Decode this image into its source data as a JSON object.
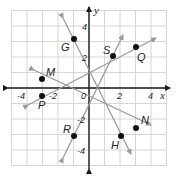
{
  "diagram": {
    "type": "coordinate-plane",
    "x_range": [
      -5,
      5
    ],
    "y_range": [
      -5,
      5
    ],
    "grid_step": 1,
    "axis_labels": {
      "x": "x",
      "y": "y"
    },
    "tick_labels": {
      "x": [
        "-4",
        "-2",
        "2",
        "4"
      ],
      "y": [
        "4",
        "2",
        "-2",
        "-4"
      ],
      "origin": "0"
    },
    "colors": {
      "grid": "#d6d6d6",
      "axes": "#1a1a1a",
      "lines": "#9a9a9a",
      "points": "#111111"
    },
    "points": [
      {
        "name": "M",
        "x": -3,
        "y": 0.6
      },
      {
        "name": "P",
        "x": -3,
        "y": -0.5
      },
      {
        "name": "G",
        "x": -1,
        "y": 3.2
      },
      {
        "name": "R",
        "x": -1,
        "y": -3.1
      },
      {
        "name": "S",
        "x": 1.5,
        "y": 2.1
      },
      {
        "name": "Q",
        "x": 3,
        "y": 2.6
      },
      {
        "name": "H",
        "x": 2,
        "y": -3
      },
      {
        "name": "N",
        "x": 3,
        "y": -2.6
      }
    ],
    "lines": [
      {
        "name": "line-MN",
        "through": [
          "M",
          "N"
        ]
      },
      {
        "name": "line-PQ",
        "through": [
          "P",
          "Q"
        ]
      },
      {
        "name": "line-GH",
        "through": [
          "G",
          "H"
        ]
      },
      {
        "name": "line-RS",
        "through": [
          "R",
          "S"
        ]
      }
    ]
  }
}
